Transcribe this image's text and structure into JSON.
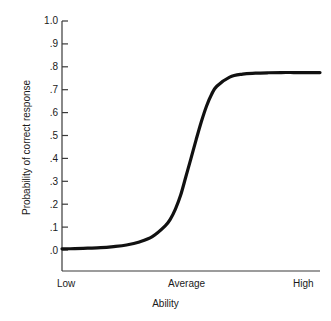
{
  "chart_data": {
    "type": "line",
    "title": "",
    "xlabel": "Ability",
    "ylabel": "Probability of correct response",
    "ylim": [
      0.0,
      1.0
    ],
    "grid": false,
    "legend": null,
    "y_ticks": [
      "1.0",
      ".9",
      ".8",
      ".7",
      ".6",
      ".5",
      ".4",
      ".3",
      ".2",
      ".1",
      ".0"
    ],
    "y_tick_values": [
      1.0,
      0.9,
      0.8,
      0.7,
      0.6,
      0.5,
      0.4,
      0.3,
      0.2,
      0.1,
      0.0
    ],
    "x_categories": [
      "Low",
      "Average",
      "High"
    ],
    "x_category_positions": [
      0.0,
      0.5,
      1.0
    ],
    "series": [
      {
        "name": "item characteristic curve",
        "color": "#111111",
        "x": [
          0.0,
          0.05,
          0.1,
          0.15,
          0.2,
          0.25,
          0.3,
          0.35,
          0.4,
          0.42,
          0.44,
          0.46,
          0.48,
          0.5,
          0.52,
          0.54,
          0.56,
          0.58,
          0.6,
          0.65,
          0.7,
          0.75,
          0.8,
          0.85,
          0.9,
          0.95,
          1.0
        ],
        "values": [
          0.005,
          0.006,
          0.008,
          0.01,
          0.015,
          0.022,
          0.035,
          0.058,
          0.105,
          0.135,
          0.18,
          0.24,
          0.32,
          0.4,
          0.482,
          0.56,
          0.628,
          0.68,
          0.715,
          0.755,
          0.768,
          0.772,
          0.774,
          0.775,
          0.775,
          0.775,
          0.775
        ]
      }
    ],
    "plateau_value": 0.775,
    "baseline_value": 0.005,
    "inflection_x_category": "Average"
  },
  "axes": {
    "x_title": "Ability",
    "y_title": "Probability of correct response"
  }
}
